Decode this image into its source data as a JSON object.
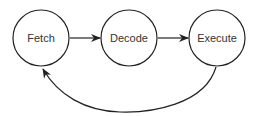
{
  "diagram": {
    "type": "cycle",
    "nodes": [
      {
        "id": "fetch",
        "label": "Fetch"
      },
      {
        "id": "decode",
        "label": "Decode"
      },
      {
        "id": "execute",
        "label": "Execute"
      }
    ],
    "edges": [
      {
        "from": "fetch",
        "to": "decode"
      },
      {
        "from": "decode",
        "to": "execute"
      },
      {
        "from": "execute",
        "to": "fetch",
        "style": "curved"
      }
    ],
    "colors": {
      "stroke": "#222222",
      "text": "#333333",
      "background": "#ffffff"
    }
  }
}
